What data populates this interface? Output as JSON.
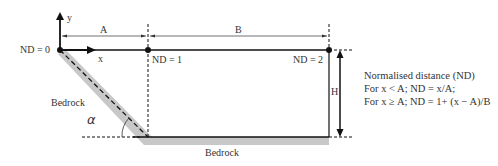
{
  "diagram": {
    "axes": {
      "x_label": "x",
      "y_label": "y"
    },
    "dimensions": {
      "A": "A",
      "B": "B",
      "H": "H"
    },
    "points": [
      {
        "id": "nd0",
        "label": "ND = 0"
      },
      {
        "id": "nd1",
        "label": "ND = 1"
      },
      {
        "id": "nd2",
        "label": "ND = 2"
      }
    ],
    "bedrock_labels": {
      "slope": "Bedrock",
      "base": "Bedrock"
    },
    "angle_label": "α",
    "legend": {
      "title": "Normalised distance (ND)",
      "line1": "For x < A; ND = x/A;",
      "line2": "For x ≥ A; ND = 1+ (x − A)/B"
    },
    "colors": {
      "line": "#111111",
      "bedrock": "#c8c8c8",
      "text": "#333333"
    }
  }
}
